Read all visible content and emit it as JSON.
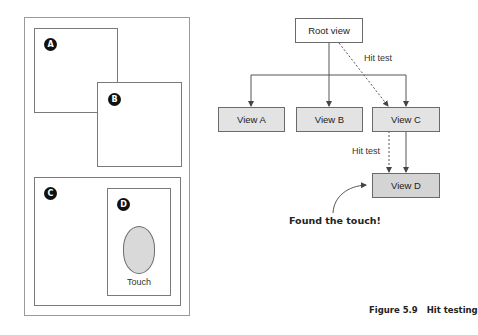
{
  "left_panel": {
    "views": [
      {
        "id": "A",
        "badge": "A"
      },
      {
        "id": "B",
        "badge": "B"
      },
      {
        "id": "C",
        "badge": "C"
      },
      {
        "id": "D",
        "badge": "D"
      }
    ],
    "touch_label": "Touch"
  },
  "tree": {
    "root": "Root view",
    "children": [
      "View A",
      "View B",
      "View C"
    ],
    "leaf": "View D",
    "hit_test_label_1": "Hit test",
    "hit_test_label_2": "Hit test",
    "annotation": "Found the touch!"
  },
  "caption": {
    "number": "Figure 5.9",
    "title": "Hit testing"
  },
  "colors": {
    "box_fill": "#e3e3e3",
    "leaf_fill": "#d4d4d4",
    "badge": "#111111",
    "touch_fill": "#d9d9d9"
  }
}
